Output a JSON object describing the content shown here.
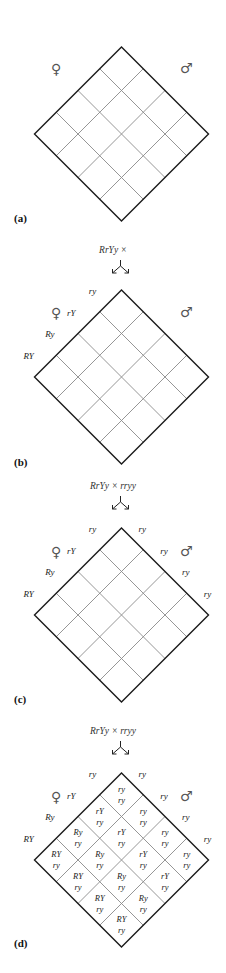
{
  "figure": {
    "panels": [
      {
        "id": "a",
        "label": "(a)",
        "female_symbol": "♀",
        "male_symbol": "♂",
        "cross": null,
        "female_gametes": [],
        "male_gametes": [],
        "cells": []
      },
      {
        "id": "b",
        "label": "(b)",
        "female_symbol": "♀",
        "male_symbol": "♂",
        "cross": "RrYy ×",
        "female_gametes": [
          "RY",
          "Ry",
          "rY",
          "ry"
        ],
        "male_gametes": [],
        "cells": []
      },
      {
        "id": "c",
        "label": "(c)",
        "female_symbol": "♀",
        "male_symbol": "♂",
        "cross": "RrYy × rryy",
        "female_gametes": [
          "RY",
          "Ry",
          "rY",
          "ry"
        ],
        "male_gametes": [
          "ry",
          "ry",
          "ry",
          "ry"
        ],
        "cells": []
      },
      {
        "id": "d",
        "label": "(d)",
        "female_symbol": "♀",
        "male_symbol": "♂",
        "cross": "RrYy × rryy",
        "female_gametes": [
          "RY",
          "Ry",
          "rY",
          "ry"
        ],
        "male_gametes": [
          "ry",
          "ry",
          "ry",
          "ry"
        ],
        "cells": [
          [
            [
              "RY",
              "ry"
            ],
            [
              "Ry",
              "ry"
            ],
            [
              "rY",
              "ry"
            ],
            [
              "ry",
              "ry"
            ]
          ],
          [
            [
              "RY",
              "ry"
            ],
            [
              "Ry",
              "ry"
            ],
            [
              "rY",
              "ry"
            ],
            [
              "ry",
              "ry"
            ]
          ],
          [
            [
              "RY",
              "ry"
            ],
            [
              "Ry",
              "ry"
            ],
            [
              "rY",
              "ry"
            ],
            [
              "ry",
              "ry"
            ]
          ],
          [
            [
              "RY",
              "ry"
            ],
            [
              "Ry",
              "ry"
            ],
            [
              "rY",
              "ry"
            ],
            [
              "ry",
              "ry"
            ]
          ]
        ]
      }
    ],
    "colors": {
      "outline": "#1a1a1a",
      "grid": "#8a8a8a",
      "symbol": "#555555"
    }
  }
}
